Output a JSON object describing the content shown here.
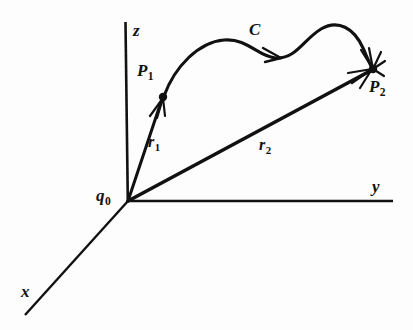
{
  "figure": {
    "kind": "vector-diagram",
    "background_color": "#fdfdfd",
    "ink_color": "#111111",
    "width": 413,
    "height": 330
  },
  "axes": [
    {
      "id": "z",
      "label": "z",
      "direction": "up",
      "from": [
        128,
        201
      ],
      "to": [
        125,
        22
      ]
    },
    {
      "id": "y",
      "label": "y",
      "direction": "right",
      "from": [
        128,
        201
      ],
      "to": [
        393,
        201
      ]
    },
    {
      "id": "x",
      "label": "x",
      "direction": "down-left",
      "from": [
        128,
        201
      ],
      "to": [
        25,
        315
      ]
    }
  ],
  "points": [
    {
      "id": "q0",
      "label": "q",
      "subscript": "0",
      "at": [
        128,
        201
      ],
      "role": "source-charge-at-origin"
    },
    {
      "id": "P1",
      "label": "P",
      "subscript": "1",
      "at": [
        163,
        97
      ],
      "role": "path-start-point"
    },
    {
      "id": "P2",
      "label": "P",
      "subscript": "2",
      "at": [
        373,
        69
      ],
      "role": "path-end-point"
    }
  ],
  "vectors": [
    {
      "id": "r1",
      "label": "r",
      "subscript": "1",
      "from": [
        128,
        201
      ],
      "to": [
        163,
        97
      ],
      "arrow": "end"
    },
    {
      "id": "r2",
      "label": "r",
      "subscript": "2",
      "from": [
        128,
        201
      ],
      "to": [
        373,
        69
      ],
      "arrow": "end"
    }
  ],
  "curve": {
    "id": "C",
    "label": "C",
    "from_point": "P1",
    "to_point": "P2",
    "arrow": "end",
    "midpoint_arrow_at": [
      278,
      55
    ],
    "description": "wavy path from P1 to P2"
  }
}
